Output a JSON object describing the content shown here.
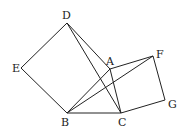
{
  "diagram": {
    "type": "geometry",
    "points": {
      "A": {
        "label": "A",
        "x": 110,
        "y": 69
      },
      "B": {
        "label": "B",
        "x": 67,
        "y": 113
      },
      "C": {
        "label": "C",
        "x": 121,
        "y": 113
      },
      "D": {
        "label": "D",
        "x": 67,
        "y": 23
      },
      "E": {
        "label": "E",
        "x": 21,
        "y": 68
      },
      "F": {
        "label": "F",
        "x": 153,
        "y": 56
      },
      "G": {
        "label": "G",
        "x": 165,
        "y": 100
      }
    },
    "segments": [
      [
        "D",
        "E"
      ],
      [
        "E",
        "B"
      ],
      [
        "B",
        "C"
      ],
      [
        "D",
        "A"
      ],
      [
        "D",
        "C"
      ],
      [
        "A",
        "C"
      ],
      [
        "B",
        "A"
      ],
      [
        "B",
        "F"
      ],
      [
        "A",
        "F"
      ],
      [
        "F",
        "G"
      ],
      [
        "G",
        "C"
      ]
    ],
    "stroke_color": "#222222"
  }
}
